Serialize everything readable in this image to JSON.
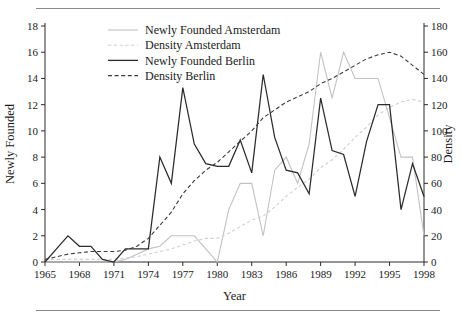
{
  "figure": {
    "has_top_rule": true,
    "has_bottom_rule": true,
    "rule_color": "#8a8a8a",
    "background": "#ffffff"
  },
  "chart_data": {
    "type": "line",
    "title": "",
    "xlabel": "Year",
    "ylabel": "Newly Founded",
    "y2label": "Density",
    "xlim": [
      1965,
      1998
    ],
    "ylim": [
      0,
      18
    ],
    "y2lim": [
      0,
      180
    ],
    "grid": false,
    "legend_position": "top-left-inside",
    "xticks": [
      1965,
      1968,
      1971,
      1974,
      1977,
      1980,
      1983,
      1986,
      1989,
      1992,
      1995,
      1998
    ],
    "xticklabels": [
      "1965",
      "1968",
      "1971",
      "1974",
      "1977",
      "1980",
      "1983",
      "1986",
      "1989",
      "1992",
      "1995",
      "1998"
    ],
    "yticks": [
      0,
      2,
      4,
      6,
      8,
      10,
      12,
      14,
      16,
      18
    ],
    "yticklabels": [
      "0",
      "2",
      "4",
      "6",
      "8",
      "10",
      "12",
      "14",
      "16",
      "18"
    ],
    "y2ticks": [
      0,
      20,
      40,
      60,
      80,
      100,
      120,
      140,
      160,
      180
    ],
    "y2ticklabels": [
      "0",
      "20",
      "40",
      "60",
      "80",
      "100",
      "120",
      "140",
      "160",
      "180"
    ],
    "x": [
      1965,
      1966,
      1967,
      1968,
      1969,
      1970,
      1971,
      1972,
      1973,
      1974,
      1975,
      1976,
      1977,
      1978,
      1979,
      1980,
      1981,
      1982,
      1983,
      1984,
      1985,
      1986,
      1987,
      1988,
      1989,
      1990,
      1991,
      1992,
      1993,
      1994,
      1995,
      1996,
      1997,
      1998
    ],
    "series": [
      {
        "name": "Newly Founded Amsterdam",
        "axis": "left",
        "color": "#c2c2c2",
        "style": "solid",
        "values": [
          0,
          0,
          0,
          0,
          0,
          0,
          0,
          0.2,
          0.6,
          1.0,
          1.2,
          2.0,
          2.0,
          2.0,
          1.0,
          0.0,
          4.0,
          6.0,
          6.0,
          2.0,
          7.0,
          8.0,
          6.0,
          9.0,
          16.0,
          12.5,
          16.0,
          14.0,
          14.0,
          14.0,
          11.0,
          8.0,
          8.0,
          2.0
        ]
      },
      {
        "name": "Density Amsterdam",
        "axis": "right",
        "color": "#cfcfcf",
        "style": "dashed",
        "values": [
          2,
          2,
          2,
          2,
          2,
          2,
          2,
          3,
          4,
          6,
          8,
          10,
          13,
          16,
          18,
          18,
          22,
          27,
          32,
          35,
          42,
          50,
          57,
          63,
          72,
          78,
          86,
          95,
          103,
          112,
          118,
          122,
          124,
          122
        ]
      },
      {
        "name": "Newly Founded Berlin",
        "axis": "left",
        "color": "#2b2b2b",
        "style": "solid",
        "values": [
          0,
          1.0,
          2.0,
          1.2,
          1.2,
          0.2,
          0.0,
          1.0,
          1.0,
          1.0,
          8.0,
          6.0,
          13.3,
          9.0,
          7.5,
          7.3,
          7.3,
          9.3,
          6.8,
          14.3,
          9.5,
          7.0,
          6.8,
          5.2,
          12.5,
          8.5,
          8.2,
          5.0,
          9.2,
          12.0,
          12.0,
          4.0,
          7.5,
          5.0
        ]
      },
      {
        "name": "Density Berlin",
        "axis": "right",
        "color": "#3a3a3a",
        "style": "dashed",
        "values": [
          2,
          4,
          6,
          7,
          8,
          8,
          8,
          9,
          12,
          18,
          28,
          38,
          52,
          62,
          70,
          76,
          84,
          92,
          100,
          110,
          116,
          122,
          126,
          130,
          136,
          140,
          145,
          150,
          155,
          158,
          160,
          157,
          150,
          143
        ]
      }
    ]
  },
  "legend": {
    "entries": [
      {
        "label": "Newly Founded Amsterdam",
        "color": "#c2c2c2",
        "style": "solid"
      },
      {
        "label": "Density Amsterdam",
        "color": "#cfcfcf",
        "style": "dashed"
      },
      {
        "label": "Newly Founded Berlin",
        "color": "#2b2b2b",
        "style": "solid"
      },
      {
        "label": "Density Berlin",
        "color": "#3a3a3a",
        "style": "dashed"
      }
    ]
  }
}
